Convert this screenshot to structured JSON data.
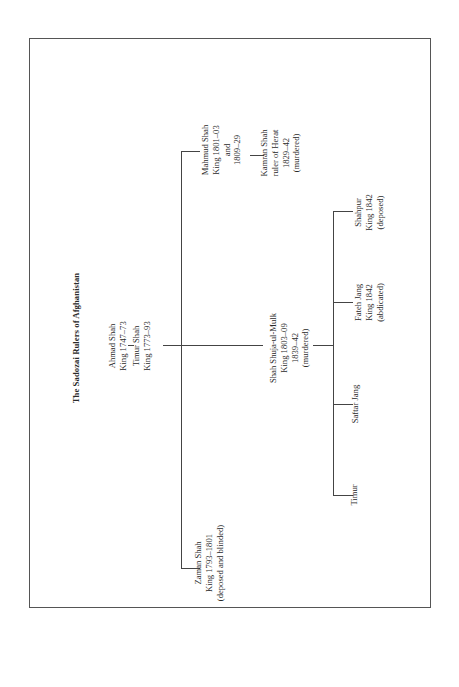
{
  "title": "The Sadozai Rulers of Afghanistan",
  "root": {
    "name": "Ahmad Shah",
    "reign": "King 1747–73",
    "child": {
      "name": "Timur Shah",
      "reign": "King 1773–93"
    }
  },
  "sons_of_timur": [
    {
      "name": "Zaman Shah",
      "reign": "King 1793–1801",
      "note": "(deposed and blinded)"
    },
    {
      "name": "Shah Shuja-ul-Mulk",
      "reign": "King 1803–09",
      "reign2": "1839–42",
      "note": "(murdered)"
    },
    {
      "name": "Mahmud Shah",
      "reign": "King 1801–03",
      "and": "and",
      "reign2": "1809–29"
    }
  ],
  "son_of_mahmud": {
    "name": "Kamran Shah",
    "title": "ruler of Herat",
    "reign": "1829–42",
    "note": "(murdered)"
  },
  "sons_of_shuja": [
    {
      "name": "Timur"
    },
    {
      "name": "Saftar Jang"
    },
    {
      "name": "Fateh Jang",
      "reign": "King 1842",
      "note": "(abdicated)"
    },
    {
      "name": "Shahpur",
      "reign": "King 1842",
      "note": "(deposed)"
    }
  ]
}
